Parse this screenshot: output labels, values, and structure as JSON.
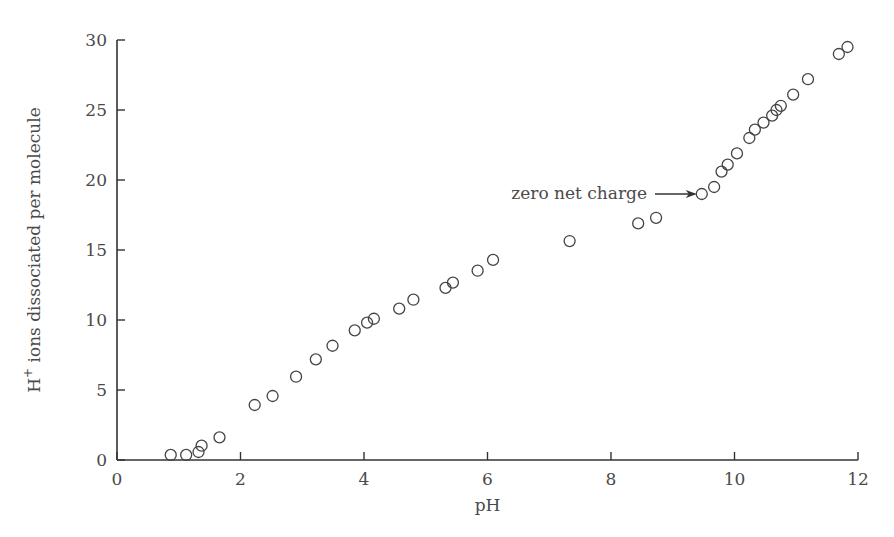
{
  "chart_data": {
    "type": "scatter",
    "title": "",
    "xlabel": "pH",
    "ylabel": "H+ ions dissociated per molecule",
    "ylabel_parts": {
      "base": "H",
      "superscript": "+",
      "rest": " ions dissociated per molecule"
    },
    "xlim": [
      0,
      12
    ],
    "ylim": [
      0,
      30
    ],
    "xticks": [
      0,
      2,
      4,
      6,
      8,
      10,
      12
    ],
    "yticks": [
      0,
      5,
      10,
      15,
      20,
      25,
      30
    ],
    "grid": false,
    "legend": null,
    "marker": "open-circle",
    "series": [
      {
        "name": "titration",
        "x": [
          0.87,
          1.12,
          1.32,
          1.37,
          1.66,
          2.23,
          2.52,
          2.9,
          3.22,
          3.49,
          3.85,
          4.05,
          4.16,
          4.57,
          4.8,
          5.32,
          5.44,
          5.84,
          6.09,
          7.33,
          8.44,
          8.73,
          9.47,
          9.67,
          9.79,
          9.89,
          10.04,
          10.24,
          10.33,
          10.47,
          10.61,
          10.68,
          10.75,
          10.95,
          11.19,
          11.69,
          11.83
        ],
        "y": [
          0.36,
          0.36,
          0.57,
          1.02,
          1.62,
          3.93,
          4.57,
          5.95,
          7.19,
          8.16,
          9.26,
          9.81,
          10.09,
          10.81,
          11.45,
          12.29,
          12.67,
          13.52,
          14.29,
          15.64,
          16.9,
          17.3,
          19.0,
          19.5,
          20.6,
          21.1,
          21.9,
          23.0,
          23.6,
          24.1,
          24.6,
          25.0,
          25.3,
          26.1,
          27.2,
          29.0,
          29.5
        ]
      }
    ],
    "annotations": [
      {
        "text": "zero net charge",
        "arrow_to": {
          "x": 9.47,
          "y": 19.0
        }
      }
    ]
  },
  "labels": {
    "xlabel": "pH",
    "ylabel_base": "H",
    "ylabel_sup": "+",
    "ylabel_rest": " ions dissociated per molecule",
    "annotation": "zero net charge"
  }
}
